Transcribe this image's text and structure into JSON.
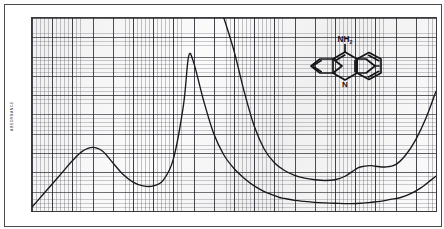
{
  "figure": {
    "ylabel": "ABSORBANCE",
    "molecule_name": "9-aminoacridine",
    "amine_label": "NH",
    "amine_sub": "2",
    "ring_nitrogen_label": "N"
  },
  "chart_data": {
    "type": "line",
    "title": "",
    "xlabel": "",
    "ylabel": "ABSORBANCE",
    "xlim": [
      200,
      360
    ],
    "ylim": [
      0.0,
      1.0
    ],
    "grid": true,
    "legend_position": "none",
    "xtick_labels": [
      "200",
      "220",
      "240",
      "260",
      "280",
      "300",
      "320",
      "340",
      "360"
    ],
    "xtick_values": [
      200,
      220,
      240,
      260,
      280,
      300,
      320,
      340,
      360
    ],
    "ytick_labels": [
      "1.0",
      "0.9",
      "0.8",
      "0.7",
      "0.6",
      "0.5",
      "0.4",
      "0.3",
      "0.2",
      "0.1",
      "0.0"
    ],
    "ytick_values": [
      1.0,
      0.9,
      0.8,
      0.7,
      0.6,
      0.5,
      0.4,
      0.3,
      0.2,
      0.1,
      0.0
    ],
    "series": [
      {
        "name": "absorbance",
        "x": [
          200,
          204,
          208,
          212,
          216,
          220,
          224,
          228,
          232,
          236,
          240,
          244,
          248,
          252,
          256,
          260,
          262,
          264,
          268,
          272,
          276,
          280,
          284,
          288,
          292,
          294,
          296,
          298,
          300,
          304,
          308,
          312,
          316,
          320,
          324,
          326,
          330,
          334,
          338,
          342,
          346,
          350,
          354,
          358,
          360
        ],
        "y": [
          0.02,
          0.08,
          0.14,
          0.2,
          0.26,
          0.31,
          0.33,
          0.31,
          0.25,
          0.19,
          0.15,
          0.13,
          0.13,
          0.16,
          0.27,
          0.55,
          0.8,
          0.77,
          0.57,
          0.4,
          0.29,
          0.22,
          0.17,
          0.13,
          0.1,
          0.09,
          0.08,
          0.07,
          0.065,
          0.055,
          0.05,
          0.045,
          0.042,
          0.04,
          0.038,
          0.038,
          0.04,
          0.045,
          0.05,
          0.06,
          0.07,
          0.09,
          0.12,
          0.16,
          0.18
        ]
      },
      {
        "name": "second-trace",
        "x": [
          276,
          280,
          284,
          288,
          292,
          296,
          300,
          304,
          308,
          312,
          316,
          320,
          324,
          328,
          330,
          334,
          336,
          340,
          344,
          348,
          352,
          356,
          360
        ],
        "y": [
          1.0,
          0.83,
          0.62,
          0.44,
          0.32,
          0.25,
          0.21,
          0.185,
          0.17,
          0.162,
          0.158,
          0.162,
          0.18,
          0.215,
          0.228,
          0.235,
          0.232,
          0.228,
          0.24,
          0.29,
          0.37,
          0.48,
          0.62
        ]
      }
    ]
  }
}
